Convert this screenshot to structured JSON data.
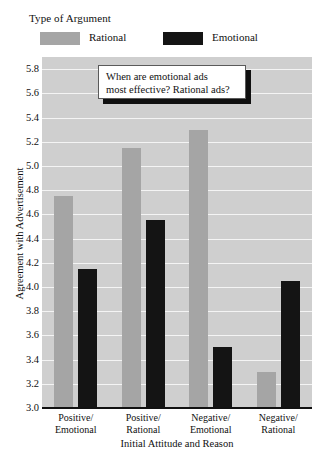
{
  "legend": {
    "title": "Type of Argument",
    "entries": [
      {
        "label": "Rational",
        "color": "#a5a5a5"
      },
      {
        "label": "Emotional",
        "color": "#141414"
      }
    ]
  },
  "callout": {
    "line1": "When are emotional ads",
    "line2": "most effective? Rational ads?"
  },
  "chart_data": {
    "type": "bar",
    "title": "",
    "xlabel": "Initial Attitude and Reason",
    "ylabel": "Agreement with Advertisement",
    "categories": [
      "Positive/ Emotional",
      "Positive/ Rational",
      "Negative/ Emotional",
      "Negative/ Rational"
    ],
    "category_lines": [
      {
        "line1": "Positive/",
        "line2": "Emotional"
      },
      {
        "line1": "Positive/",
        "line2": "Rational"
      },
      {
        "line1": "Negative/",
        "line2": "Emotional"
      },
      {
        "line1": "Negative/",
        "line2": "Rational"
      }
    ],
    "series": [
      {
        "name": "Rational",
        "color": "#a5a5a5",
        "values": [
          4.75,
          5.15,
          5.3,
          3.3
        ]
      },
      {
        "name": "Emotional",
        "color": "#141414",
        "values": [
          4.15,
          4.55,
          3.5,
          4.05
        ]
      }
    ],
    "ylim": [
      3.0,
      5.9
    ],
    "ytick_values": [
      3.0,
      3.2,
      3.4,
      3.6,
      3.8,
      4.0,
      4.2,
      4.4,
      4.6,
      4.8,
      5.0,
      5.2,
      5.4,
      5.6,
      5.8
    ],
    "ytick_labels": [
      "3.0",
      "3.2",
      "3.4",
      "3.6",
      "3.8",
      "4.0",
      "4.2",
      "4.4",
      "4.6",
      "4.8",
      "5.0",
      "5.2",
      "5.4",
      "5.6",
      "5.8"
    ],
    "grid": true,
    "legend_position": "above-plot",
    "plot_background": "#cfcfcf",
    "gridline_color": "#f4f4f4"
  }
}
